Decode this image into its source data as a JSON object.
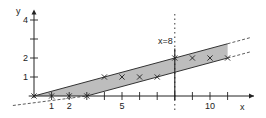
{
  "chart_data": {
    "type": "scatter",
    "title": "",
    "xlabel": "x",
    "ylabel": "y",
    "xlim": [
      -1.5,
      12.5
    ],
    "ylim": [
      -0.8,
      4.5
    ],
    "x_ticks": [
      1,
      2,
      3,
      4,
      5,
      6,
      7,
      8,
      9,
      10,
      11
    ],
    "x_tick_labels": {
      "1": "1",
      "2": "2",
      "5": "5",
      "10": "10"
    },
    "y_ticks": [
      1,
      2,
      3,
      4
    ],
    "y_tick_labels": {
      "1": "1",
      "2": "2",
      "4": "4"
    },
    "points": [
      {
        "x": 0,
        "y": 0
      },
      {
        "x": 1,
        "y": 0
      },
      {
        "x": 2,
        "y": 0
      },
      {
        "x": 3,
        "y": 0
      },
      {
        "x": 4,
        "y": 1
      },
      {
        "x": 5,
        "y": 1
      },
      {
        "x": 6,
        "y": 1
      },
      {
        "x": 7,
        "y": 1
      },
      {
        "x": 8,
        "y": 2
      },
      {
        "x": 9,
        "y": 2
      },
      {
        "x": 10,
        "y": 2
      },
      {
        "x": 11,
        "y": 2
      }
    ],
    "lines": [
      {
        "name": "upper-bound",
        "slope": 0.25,
        "intercept": 0,
        "solid_range": [
          0,
          11
        ],
        "dashed_range": [
          11,
          12.3
        ]
      },
      {
        "name": "lower-bound",
        "slope": 0.25,
        "intercept": -0.75,
        "solid_range": [
          3,
          11
        ],
        "dashed_range": [
          -1.2,
          3
        ],
        "dashed_tail": [
          11,
          12.3
        ]
      }
    ],
    "band_fill": "#b8b8b8",
    "vertical_marker": {
      "x": 8,
      "label": "x=8",
      "style": "dotted"
    },
    "grid": false,
    "legend": null
  },
  "labels": {
    "x_axis": "x",
    "y_axis": "y",
    "marker": "x=8"
  },
  "colors": {
    "axis": "#222222",
    "band": "#bdbdbd",
    "line": "#333333"
  }
}
